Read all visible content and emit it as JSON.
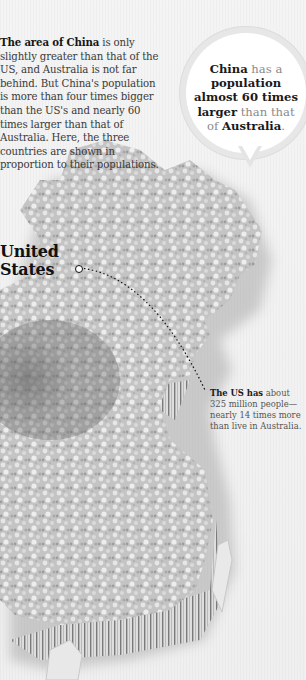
{
  "intro": {
    "lead_bold": "The area of China",
    "text": " is only slightly greater than that of the US, and Australia is not far behind. But China's population is more than four times bigger than the US's and nearly 60 times larger than that of Australia. Here, the three countries are shown in proportion to their populations."
  },
  "bubble": {
    "part1_bold": "China",
    "part2": " has a ",
    "part3_bold": "population almost 60 times larger",
    "part4": " than that of ",
    "part5_bold": "Australia",
    "part6": "."
  },
  "labels": {
    "us_line1": "United",
    "us_line2": "States"
  },
  "us_note": {
    "lead_bold": "The US has",
    "text": " about 325 million people—nearly 14 times more than live in Australia."
  },
  "colors": {
    "background": "#f3f3f3",
    "text_dark": "#1a1a1a",
    "text_body": "#3a3a3a",
    "text_muted": "#8a8a8a",
    "map_fill": "#c9c9c9",
    "map_shadow": "#8e8e8e"
  },
  "map": {
    "description": "3D extruded map of China made of crowd imagery, scaled to population",
    "icon": "china-map-crowd"
  }
}
